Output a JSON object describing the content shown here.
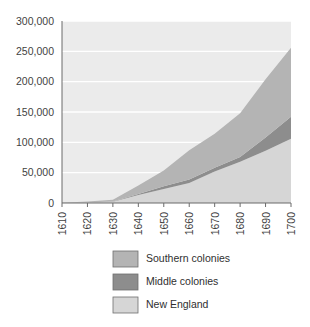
{
  "chart_data": {
    "type": "area",
    "stacked": true,
    "title": "",
    "subtitle": "",
    "xlabel": "",
    "ylabel": "",
    "x": [
      1610,
      1620,
      1630,
      1640,
      1650,
      1660,
      1670,
      1680,
      1690,
      1700
    ],
    "categories": [
      "1610",
      "1620",
      "1630",
      "1640",
      "1650",
      "1660",
      "1670",
      "1680",
      "1690",
      "1700"
    ],
    "xlim": [
      1610,
      1700
    ],
    "ylim": [
      0,
      300000
    ],
    "ytick_labels": [
      "0",
      "50,000",
      "100,000",
      "150,000",
      "200,000",
      "250,000",
      "300,000"
    ],
    "ytick_values": [
      0,
      50000,
      100000,
      150000,
      200000,
      250000,
      300000
    ],
    "grid": "horizontal",
    "legend_position": "bottom",
    "stack_order_bottom_to_top": [
      "New England",
      "Middle colonies",
      "Southern colonies"
    ],
    "series": [
      {
        "name": "New England",
        "color": "#d6d6d6",
        "values": [
          0,
          1000,
          2000,
          13000,
          23000,
          33000,
          52000,
          68000,
          86000,
          106000
        ]
      },
      {
        "name": "Middle colonies",
        "color": "#8d8d8d",
        "values": [
          0,
          0,
          400,
          1900,
          4500,
          5800,
          6000,
          8000,
          22000,
          36000
        ]
      },
      {
        "name": "Southern colonies",
        "color": "#b4b4b4",
        "values": [
          350,
          1500,
          3000,
          14000,
          26000,
          48000,
          56000,
          72000,
          96000,
          114000
        ]
      }
    ],
    "totals": [
      350,
      2500,
      5400,
      28900,
      53500,
      86800,
      114000,
      148000,
      204000,
      256000
    ]
  },
  "legend": {
    "items": [
      {
        "label": "Southern colonies",
        "color": "#b4b4b4"
      },
      {
        "label": "Middle colonies",
        "color": "#8d8d8d"
      },
      {
        "label": "New England",
        "color": "#d6d6d6"
      }
    ]
  },
  "style": {
    "plot_background": "#ebebeb",
    "gridline_color": "#ffffff",
    "axis_color": "#6b6b6b",
    "text_color": "#3f3f3f",
    "page_background": "#ffffff"
  }
}
